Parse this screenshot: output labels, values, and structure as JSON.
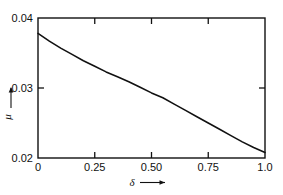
{
  "chart_data": {
    "type": "line",
    "title": "",
    "subtitle": "",
    "xlabel": "δ",
    "ylabel": "μ",
    "xlabel_suffix": "→",
    "ylabel_suffix": "↑",
    "xlim": [
      0,
      1.0
    ],
    "ylim": [
      0.02,
      0.04
    ],
    "grid": false,
    "legend": null,
    "x_ticks": [
      0,
      0.25,
      0.5,
      0.75,
      1.0
    ],
    "x_tick_labels": [
      "0",
      "0.25",
      "0.50",
      "0.75",
      "1.0"
    ],
    "y_ticks": [
      0.02,
      0.03,
      0.04
    ],
    "y_tick_labels": [
      "0.02",
      "0.03",
      "0.04"
    ],
    "series": [
      {
        "name": "mu",
        "color": "#111111",
        "line_width": 1.6,
        "x": [
          0.0,
          0.05,
          0.1,
          0.15,
          0.2,
          0.25,
          0.3,
          0.35,
          0.4,
          0.45,
          0.5,
          0.55,
          0.6,
          0.65,
          0.7,
          0.75,
          0.8,
          0.85,
          0.9,
          0.95,
          1.0
        ],
        "values": [
          0.0378,
          0.0367,
          0.0357,
          0.0348,
          0.0339,
          0.0331,
          0.0323,
          0.0316,
          0.0309,
          0.0301,
          0.0293,
          0.0286,
          0.0277,
          0.0268,
          0.0259,
          0.025,
          0.0241,
          0.0232,
          0.0223,
          0.0215,
          0.0208
        ]
      }
    ],
    "frame": {
      "box": true,
      "ticks_inward": true,
      "top_ticks_at": [
        0.25,
        0.5,
        0.75
      ],
      "right_ticks_at": [
        0.03
      ],
      "color": "#111111"
    }
  }
}
